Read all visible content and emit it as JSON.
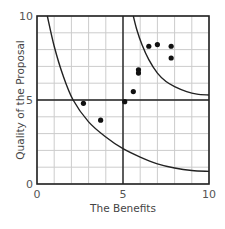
{
  "chart_data": {
    "type": "scatter",
    "title": "",
    "xlabel": "The Benefits",
    "ylabel": "Quality of the Proposal",
    "xlim": [
      0,
      10
    ],
    "ylim": [
      0,
      10
    ],
    "grid": true,
    "grid_step": 1,
    "x_ticks": [
      "0",
      "5",
      "10"
    ],
    "y_ticks": [
      "0",
      "5",
      "10"
    ],
    "quadrant_lines": {
      "x": 5,
      "y": 5
    },
    "points": [
      {
        "x": 2.7,
        "y": 4.8
      },
      {
        "x": 3.7,
        "y": 3.8
      },
      {
        "x": 5.1,
        "y": 4.9
      },
      {
        "x": 5.6,
        "y": 5.5
      },
      {
        "x": 5.9,
        "y": 6.8
      },
      {
        "x": 5.9,
        "y": 6.6
      },
      {
        "x": 6.5,
        "y": 8.2
      },
      {
        "x": 7.0,
        "y": 8.3
      },
      {
        "x": 7.8,
        "y": 8.2
      },
      {
        "x": 7.8,
        "y": 7.5
      }
    ],
    "curves": [
      {
        "name": "lower-threshold-curve",
        "points": [
          [
            0.6,
            10
          ],
          [
            1.0,
            8.2
          ],
          [
            1.5,
            6.5
          ],
          [
            2.1,
            5.0
          ],
          [
            3.0,
            3.7
          ],
          [
            4.0,
            2.8
          ],
          [
            5.0,
            2.1
          ],
          [
            6.0,
            1.6
          ],
          [
            7.0,
            1.2
          ],
          [
            8.0,
            0.95
          ],
          [
            9.0,
            0.8
          ],
          [
            10.0,
            0.75
          ]
        ]
      },
      {
        "name": "upper-threshold-curve",
        "points": [
          [
            5.6,
            10
          ],
          [
            5.8,
            9.2
          ],
          [
            6.1,
            8.3
          ],
          [
            6.5,
            7.4
          ],
          [
            7.0,
            6.6
          ],
          [
            7.5,
            6.1
          ],
          [
            8.0,
            5.8
          ],
          [
            8.7,
            5.5
          ],
          [
            9.3,
            5.35
          ],
          [
            10.0,
            5.3
          ]
        ]
      }
    ],
    "colors": {
      "axis": "#222222",
      "grid": "#cccccc",
      "point": "#111111",
      "curve": "#222222"
    }
  }
}
